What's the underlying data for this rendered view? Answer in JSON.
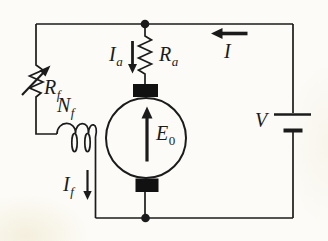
{
  "diagram": {
    "type": "circuit-schematic",
    "description_visible_elements": "dc motor circuit with field rheostat, field winding, armature resistor, motor emf source and battery",
    "colors": {
      "wire": "#1b1b1b",
      "background": "#fcfbf7",
      "brush_block": "#111111"
    },
    "labels": {
      "field_resistor": {
        "main": "R",
        "sub": "f"
      },
      "field_winding": {
        "main": "N",
        "sub": "f"
      },
      "field_current": {
        "main": "I",
        "sub": "f"
      },
      "armature_current": {
        "main": "I",
        "sub": "a"
      },
      "armature_resistor": {
        "main": "R",
        "sub": "a"
      },
      "line_current": {
        "main": "I",
        "sub": ""
      },
      "motor_emf": {
        "main": "E",
        "sub": "0"
      },
      "supply_voltage": {
        "main": "V",
        "sub": ""
      }
    }
  }
}
